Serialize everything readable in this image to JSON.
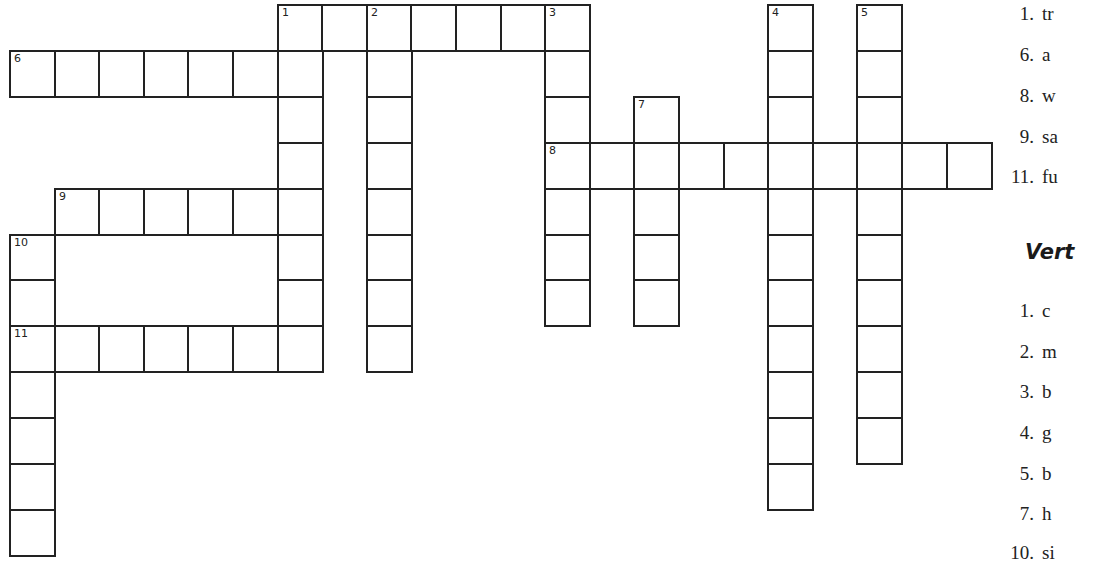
{
  "puzzle": {
    "grid": {
      "origin_x": 9,
      "origin_y": 4,
      "cell_w": 44.6,
      "cell_h": 45.9,
      "words": [
        {
          "number": "1",
          "direction": "across",
          "row": 0,
          "col": 6,
          "length": 7
        },
        {
          "number": "6",
          "direction": "across",
          "row": 1,
          "col": 0,
          "length": 7
        },
        {
          "number": "8",
          "direction": "across",
          "row": 3,
          "col": 12,
          "length": 10
        },
        {
          "number": "9",
          "direction": "across",
          "row": 4,
          "col": 1,
          "length": 6
        },
        {
          "number": "11",
          "direction": "across",
          "row": 7,
          "col": 0,
          "length": 7
        },
        {
          "number": "1",
          "direction": "down",
          "row": 0,
          "col": 6,
          "length": 8
        },
        {
          "number": "2",
          "direction": "down",
          "row": 0,
          "col": 8,
          "length": 8
        },
        {
          "number": "3",
          "direction": "down",
          "row": 0,
          "col": 12,
          "length": 7
        },
        {
          "number": "4",
          "direction": "down",
          "row": 0,
          "col": 17,
          "length": 11
        },
        {
          "number": "5",
          "direction": "down",
          "row": 0,
          "col": 19,
          "length": 10
        },
        {
          "number": "7",
          "direction": "down",
          "row": 2,
          "col": 14,
          "length": 5
        },
        {
          "number": "10",
          "direction": "down",
          "row": 5,
          "col": 0,
          "length": 7
        }
      ]
    },
    "clues": {
      "across_items": [
        {
          "number": "1.",
          "text": "tr"
        },
        {
          "number": "6.",
          "text": "a"
        },
        {
          "number": "8.",
          "text": "w"
        },
        {
          "number": "9.",
          "text": "sa"
        },
        {
          "number": "11.",
          "text": "fu"
        }
      ],
      "vertical_title": "Vert",
      "vertical_items": [
        {
          "number": "1.",
          "text": "c"
        },
        {
          "number": "2.",
          "text": "m"
        },
        {
          "number": "3.",
          "text": "b"
        },
        {
          "number": "4.",
          "text": "g"
        },
        {
          "number": "5.",
          "text": "b"
        },
        {
          "number": "7.",
          "text": "h"
        },
        {
          "number": "10.",
          "text": "si"
        }
      ]
    }
  }
}
